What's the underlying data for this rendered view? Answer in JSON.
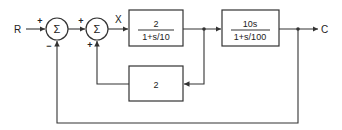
{
  "diagram": {
    "type": "block-diagram",
    "input_label": "R",
    "output_label": "C",
    "intermediate_label": "X",
    "summing_junctions": [
      {
        "id": "sum1",
        "symbol": "Σ",
        "input_sign": "+",
        "feedback_sign": "−"
      },
      {
        "id": "sum2",
        "symbol": "Σ",
        "input_sign": "+",
        "feedback_sign": "+"
      }
    ],
    "blocks": [
      {
        "id": "forward1",
        "numerator": "2",
        "denominator": "1+s/10"
      },
      {
        "id": "forward2",
        "numerator": "10s",
        "denominator": "1+s/100"
      },
      {
        "id": "feedback_inner",
        "gain": "2"
      }
    ]
  },
  "colors": {
    "line": "#333333",
    "background": "#ffffff"
  }
}
